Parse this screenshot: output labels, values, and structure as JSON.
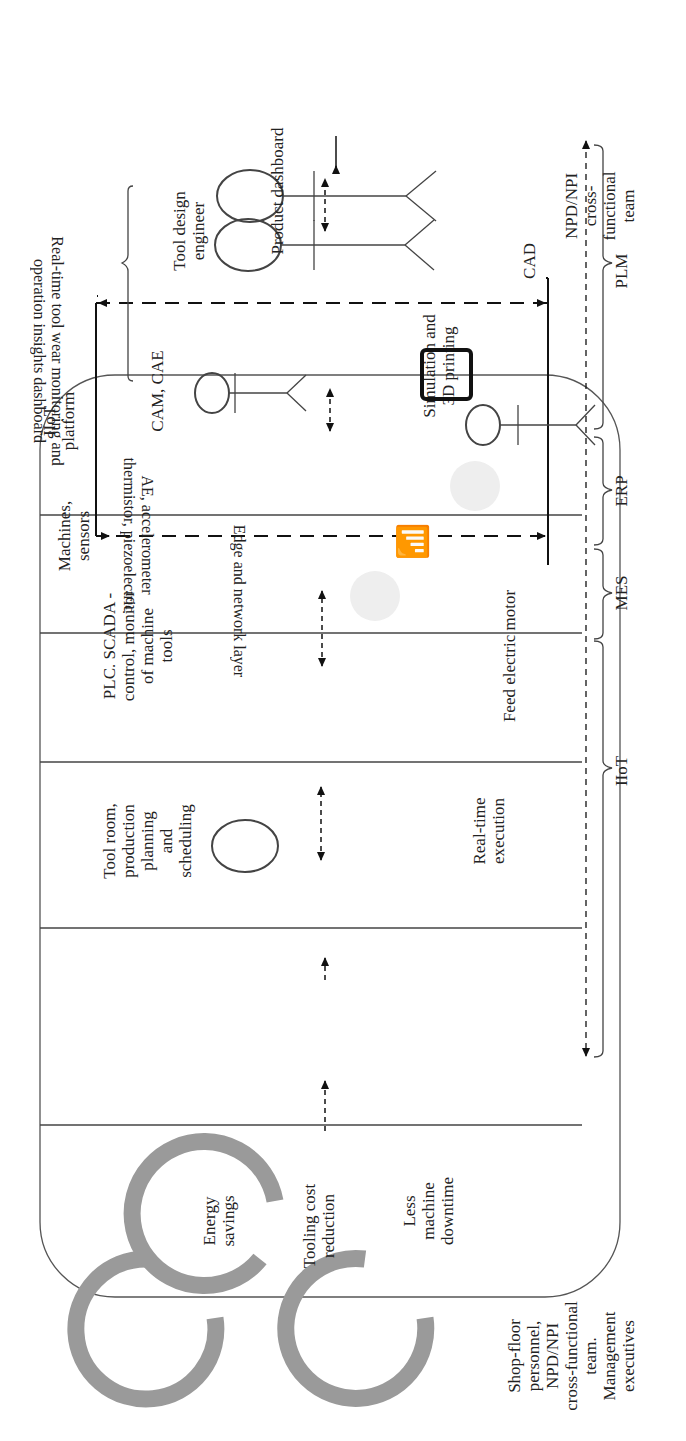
{
  "benefits": {
    "items": [
      {
        "label": "Energy savings",
        "lines": [
          "Energy",
          "savings"
        ]
      },
      {
        "label": "Tooling cost reduction",
        "lines": [
          "Tooling cost",
          "reduction"
        ]
      },
      {
        "label": "Less machine downtime",
        "lines": [
          "Less",
          "machine",
          "downtime"
        ]
      }
    ],
    "ring_color": "#9a9a9a"
  },
  "actors": {
    "left_external": {
      "lines": [
        "NPD/NPI",
        "cross-",
        "functional",
        "team"
      ]
    },
    "right_external": {
      "lines": [
        "Shop-floor",
        "personnel,",
        "NPD/NPI",
        "cross-functional",
        "team.",
        "Management",
        "executives"
      ]
    }
  },
  "columns": [
    {
      "id": "tool-design",
      "title_lines": [
        "Tool design",
        "engineer"
      ],
      "bottom_label": "CAD",
      "footer": "Product dashboard"
    },
    {
      "id": "cam-cae",
      "title": "CAM, CAE",
      "sub_actor": "Simulation and 3D printing",
      "sub_lines": [
        "Simulation and",
        "3D printing"
      ]
    },
    {
      "id": "tool-room",
      "title_lines": [
        "Tool room,",
        "production",
        "planning",
        "and",
        "scheduling"
      ],
      "bottom_lines": [
        "Real-time",
        "execution"
      ]
    },
    {
      "id": "plc-scada",
      "title_lines": [
        "PLC. SCADA -",
        "control, monitor",
        "of machine",
        "tools"
      ],
      "bottom_label": "Feed electric motor"
    },
    {
      "id": "machines",
      "title_lines": [
        "Machines,",
        "sensors"
      ],
      "sensor_lines": [
        "AE, accelerometer",
        "thermistor, piezoelectric"
      ],
      "edge_label": "Edge and network layer"
    },
    {
      "id": "iiot-platform",
      "title_lines": [
        "IIoT",
        "platform"
      ],
      "dashboard_lines": [
        "Real-time tool wear monitoring  and",
        "operation insights dashboard"
      ]
    }
  ],
  "system_brackets": [
    {
      "label": "PLM"
    },
    {
      "label": "ERP"
    },
    {
      "label": "MES"
    },
    {
      "label": "IIoT"
    }
  ],
  "icons": [
    "machine-tool-icon",
    "wireless-signal-icon",
    "machine-tool-icon",
    "dashboard-chart-icon"
  ]
}
